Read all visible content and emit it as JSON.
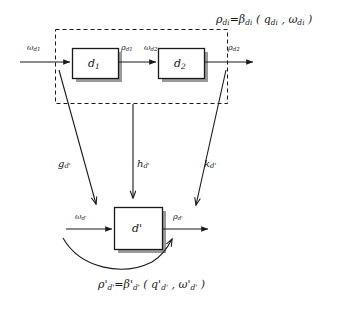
{
  "diagram": {
    "title_formula_top": "ρdi=βdi ( qdi , ωdi )",
    "title_formula_bottom": "ρ'd'=β'd' ( q'd' , ω'd' )",
    "top_chain": {
      "input_label": "ωd1",
      "blocks": [
        {
          "label": "d1",
          "name": "block-d1"
        },
        {
          "label": "d2",
          "name": "block-d2"
        }
      ],
      "intermediate_out_label": "ρd1",
      "intermediate_in_label": "ωd2",
      "output_label": "ρd2",
      "group_style": "dashed-rectangle"
    },
    "mapping_arrows": [
      {
        "label": "gd'",
        "name": "mapping-arrow-g"
      },
      {
        "label": "hd'",
        "name": "mapping-arrow-h"
      },
      {
        "label": "kd'",
        "name": "mapping-arrow-k"
      }
    ],
    "bottom_chain": {
      "input_label": "ωd'",
      "block_label": "d'",
      "output_label": "ρd'",
      "feedback": "curved-arrow"
    },
    "colors": {
      "stroke": "#1a1a1a",
      "shadow": "#8c8c8c",
      "background": "#ffffff",
      "box_fill": "#ffffff"
    }
  }
}
